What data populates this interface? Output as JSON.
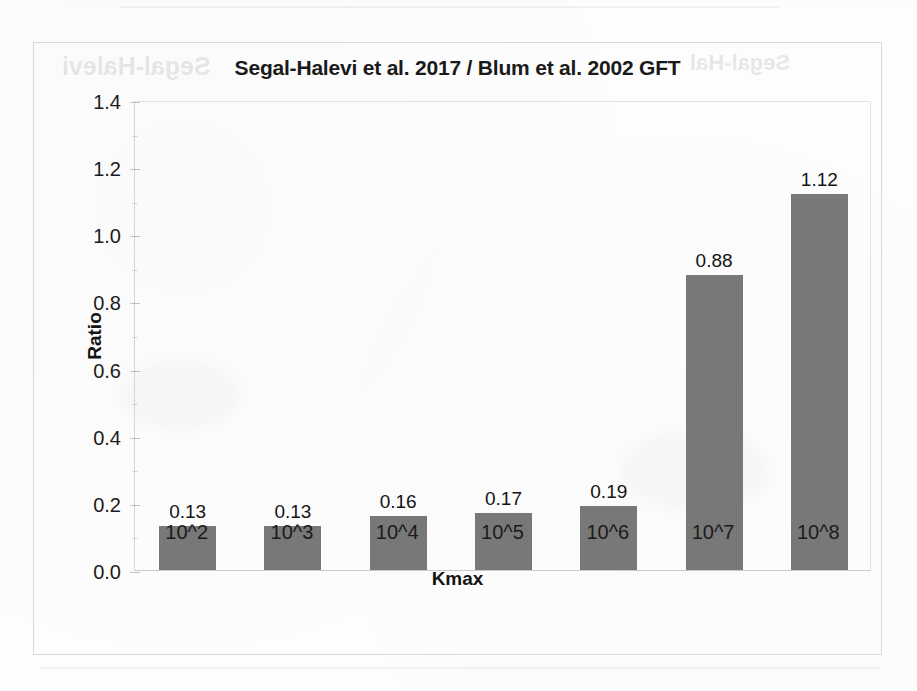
{
  "page": {
    "background_color": "#fdfdfd",
    "bleed_through_left": "Segal-Halevi",
    "bleed_through_right": "Segal-Hal"
  },
  "chart_data": {
    "type": "bar",
    "title": "Segal-Halevi et al. 2017 / Blum et al. 2002 GFT",
    "xlabel": "Kmax",
    "ylabel": "Ratio",
    "categories": [
      "10^2",
      "10^3",
      "10^4",
      "10^5",
      "10^6",
      "10^7",
      "10^8"
    ],
    "values": [
      0.13,
      0.13,
      0.16,
      0.17,
      0.19,
      0.88,
      1.12
    ],
    "data_labels": [
      "0.13",
      "0.13",
      "0.16",
      "0.17",
      "0.19",
      "0.88",
      "1.12"
    ],
    "ylim": [
      0.0,
      1.4
    ],
    "ytick_labels": [
      "0.0",
      "0.2",
      "0.4",
      "0.6",
      "0.8",
      "1.0",
      "1.2",
      "1.4"
    ],
    "ytick_values": [
      0.0,
      0.2,
      0.4,
      0.6,
      0.8,
      1.0,
      1.2,
      1.4
    ],
    "grid": false,
    "legend": false,
    "bar_color": "#787878",
    "text_color": "#141414",
    "frame_color": "#d9d9dc"
  }
}
